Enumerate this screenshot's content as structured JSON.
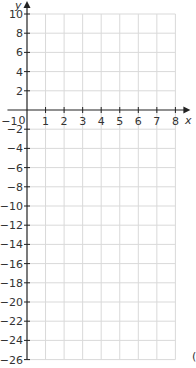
{
  "chart_data": {
    "type": "line",
    "title": "",
    "xlabel": "x",
    "ylabel": "y",
    "xlim": [
      -1,
      8
    ],
    "ylim": [
      -26,
      10
    ],
    "x_ticks": [
      1,
      2,
      3,
      4,
      5,
      6,
      7,
      8
    ],
    "x_tick_labels": [
      "1",
      "2",
      "3",
      "4",
      "5",
      "6",
      "7",
      "8"
    ],
    "x_extra_labels": [
      "-1",
      "0"
    ],
    "y_ticks": [
      10,
      8,
      6,
      4,
      2,
      -2,
      -4,
      -6,
      -8,
      -10,
      -12,
      -14,
      -16,
      -18,
      -20,
      -22,
      -24,
      -26
    ],
    "y_tick_labels": [
      "10",
      "8",
      "6",
      "4",
      "2",
      "−2",
      "−4",
      "−6",
      "−8",
      "−10",
      "−12",
      "−14",
      "−16",
      "−18",
      "−20",
      "−22",
      "−24",
      "−26"
    ],
    "grid": true,
    "grid_x_step": 1,
    "grid_y_step": 2,
    "series": [],
    "legend": null
  },
  "colors": {
    "axis": "#222222",
    "grid": "#d9d9d9",
    "text": "#333333"
  },
  "edge_fragment": "("
}
